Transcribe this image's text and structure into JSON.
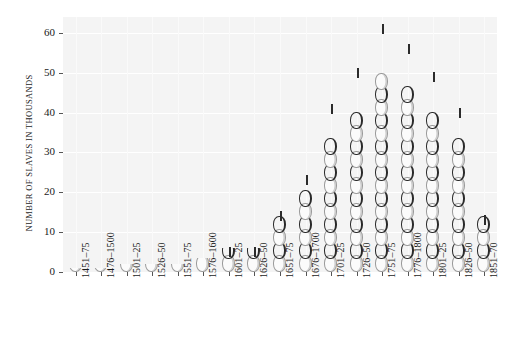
{
  "chart_data": {
    "type": "bar",
    "title": "",
    "subtitle": "",
    "xlabel": "",
    "ylabel": "NUMBER OF SLAVES IN THOUSANDS",
    "ylim": [
      0,
      64
    ],
    "yticks": [
      0,
      10,
      20,
      30,
      40,
      50,
      60
    ],
    "ytick_labels": [
      "0",
      "10",
      "20",
      "30",
      "40",
      "50",
      "60"
    ],
    "grid": true,
    "legend": null,
    "bar_style": "chain-links",
    "categories": [
      "1451–75",
      "1476–1500",
      "1501–25",
      "1526–50",
      "1551–75",
      "1576–1600",
      "1601–25",
      "1626–50",
      "1651–75",
      "1676–1700",
      "1701–25",
      "1726–50",
      "1751–75",
      "1776–1800",
      "1801–25",
      "1826–50",
      "1851–70"
    ],
    "values": [
      1,
      1,
      2,
      2,
      2,
      3.5,
      6,
      6,
      15,
      24,
      42,
      51,
      62,
      57,
      50,
      41,
      14
    ],
    "annotations": []
  },
  "colors": {
    "plot_background": "#f4f4f4",
    "gridline": "#ffffff",
    "link_outline": "#9a9a9a",
    "link_shadow": "#2a2a2a",
    "text": "#1a1a1a",
    "page_background": "#ffffff"
  }
}
